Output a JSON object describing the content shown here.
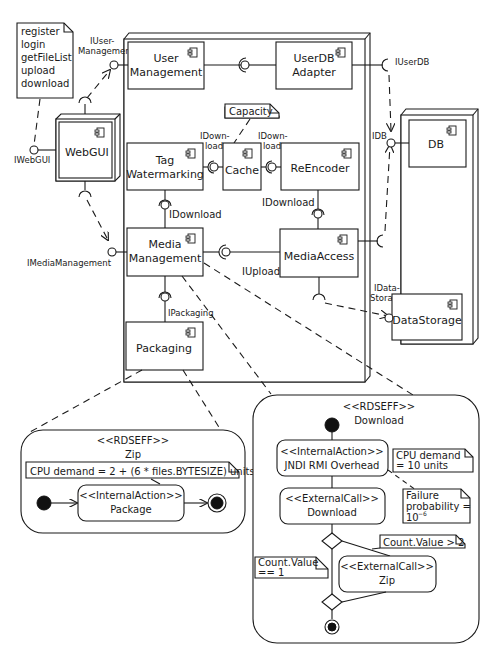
{
  "diagram": {
    "note_webgui_ops": [
      "register",
      "login",
      "getFileList",
      "upload",
      "download"
    ],
    "interfaces": {
      "iwebgui": "IWebGUI",
      "iuser_management_1": "IUser-",
      "iuser_management_2": "Management",
      "iuserdb": "IUserDB",
      "idb": "IDB",
      "imedia_management": "IMediaManagement",
      "idownload_tw": "IDownload",
      "idownload_re": "IDownload",
      "idownload_cache_left_1": "IDown-",
      "idownload_cache_left_2": "load",
      "idownload_cache_right_1": "IDown-",
      "idownload_cache_right_2": "load",
      "iupload": "IUpload",
      "ipackaging": "IPackaging",
      "idatastorage_1": "IData-",
      "idatastorage_2": "Storage"
    },
    "components": {
      "webgui": "WebGUI",
      "user_management_1": "User",
      "user_management_2": "Management",
      "userdb_adapter_1": "UserDB",
      "userdb_adapter_2": "Adapter",
      "tag_watermarking_1": "Tag",
      "tag_watermarking_2": "Watermarking",
      "cache": "Cache",
      "reencoder": "ReEncoder",
      "media_management_1": "Media",
      "media_management_2": "Management",
      "media_access": "MediaAccess",
      "packaging": "Packaging",
      "db": "DB",
      "data_storage": "DataStorage"
    },
    "notes": {
      "capacity": "Capacity"
    },
    "rdseff_zip": {
      "stereotype": "<<RDSEFF>>",
      "name": "Zip",
      "note": "CPU demand = 2 + (6 * files.BYTESIZE) units",
      "action_stereotype": "<<InternalAction>>",
      "action_name": "Package"
    },
    "rdseff_download": {
      "stereotype": "<<RDSEFF>>",
      "name": "Download",
      "internal_stereotype": "<<InternalAction>>",
      "internal_name": "JNDI RMI Overhead",
      "cpu_note_1": "CPU demand",
      "cpu_note_2": "= 10 units",
      "ext1_stereotype": "<<ExternalCall>>",
      "ext1_name": "Download",
      "failure_note_1": "Failure",
      "failure_note_2": "probability =",
      "failure_note_3": "10",
      "failure_note_exp": "−6",
      "count_gt_note": "Count.Value > 2",
      "count_eq_note_1": "Count.Value",
      "count_eq_note_2": "== 1",
      "ext2_stereotype": "<<ExternalCall>>",
      "ext2_name": "Zip"
    }
  }
}
